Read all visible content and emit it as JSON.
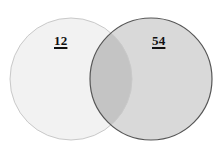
{
  "diagram": {
    "type": "venn-2set",
    "background_color": "#ffffff",
    "width": 222,
    "height": 154,
    "left_circle": {
      "name": "left-set",
      "label": "12",
      "cx": 71,
      "cy": 79,
      "r": 61,
      "fill_color": "#f2f2f2",
      "stroke_color": "#c9c9c9",
      "stroke_width": 1
    },
    "right_circle": {
      "name": "right-set",
      "label": "54",
      "cx": 151,
      "cy": 79,
      "r": 61,
      "fill_color": "#d9d9d9",
      "stroke_color": "#565656",
      "stroke_width": 1.2
    },
    "intersection": {
      "name": "overlap-region",
      "label": "",
      "fill_color": "#c4c4c4"
    }
  },
  "chart_data": {
    "type": "venn",
    "title": "",
    "sets": [
      {
        "name": "left",
        "label": "12",
        "value": 12
      },
      {
        "name": "right",
        "label": "54",
        "value": 54
      }
    ],
    "intersection_label": "",
    "labels_underlined": true
  }
}
